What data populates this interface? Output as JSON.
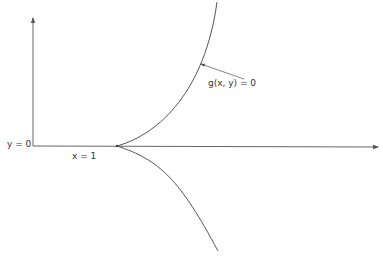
{
  "diagram": {
    "labels": {
      "y_axis_value": "y = 0",
      "x_mark": "x = 1",
      "curve_label": "g(x, y) = 0"
    },
    "colors": {
      "stroke": "#555555",
      "text": "#333333",
      "background": "#ffffff"
    },
    "elements": [
      {
        "type": "axis",
        "orientation": "vertical",
        "direction": "up"
      },
      {
        "type": "axis",
        "orientation": "horizontal",
        "direction": "right"
      },
      {
        "type": "curve",
        "branch": "upper",
        "from": "cusp at x=1",
        "to": "top"
      },
      {
        "type": "curve",
        "branch": "lower",
        "from": "cusp at x=1",
        "to": "bottom"
      },
      {
        "type": "pointer-arrow",
        "target": "upper curve",
        "label": "g(x, y) = 0"
      }
    ]
  }
}
